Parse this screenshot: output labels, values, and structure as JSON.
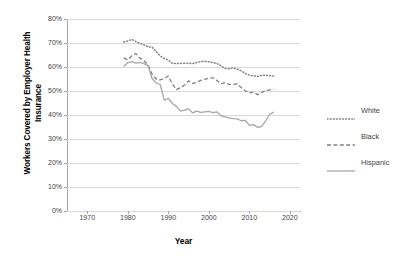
{
  "chart_data": {
    "type": "line",
    "title": "",
    "xlabel": "Year",
    "ylabel": "Workers Covered by Employer Health Insurance",
    "ylabel_line1": "Workers Covered by Employer Health",
    "ylabel_line2": "Insurance",
    "xlim": [
      1965,
      12020
    ],
    "x_axis_min": 1965,
    "x_axis_max": 2022.5,
    "ylim": [
      0,
      80
    ],
    "y_unit": "%",
    "grid": true,
    "legend_position": "right",
    "x_ticks": [
      "1970",
      "1980",
      "1990",
      "2000",
      "2010",
      "2020"
    ],
    "x_tick_values": [
      1970,
      1980,
      1990,
      2000,
      2010,
      2020
    ],
    "y_ticks": [
      "0%",
      "10%",
      "20%",
      "30%",
      "40%",
      "50%",
      "60%",
      "70%",
      "80%"
    ],
    "y_tick_values": [
      0,
      10,
      20,
      30,
      40,
      50,
      60,
      70,
      80
    ],
    "x": [
      1979,
      1980,
      1981,
      1982,
      1983,
      1984,
      1985,
      1986,
      1987,
      1988,
      1989,
      1990,
      1991,
      1992,
      1993,
      1994,
      1995,
      1996,
      1997,
      1998,
      1999,
      2000,
      2001,
      2002,
      2003,
      2004,
      2005,
      2006,
      2007,
      2008,
      2009,
      2010,
      2011,
      2012,
      2013,
      2014,
      2015,
      2016
    ],
    "series": [
      {
        "name": "White",
        "style": "dotted",
        "color": "#808080",
        "values": [
          70.4,
          70.8,
          71.5,
          70.6,
          69.8,
          69.2,
          68.4,
          68.3,
          66.4,
          64.6,
          63.6,
          62.9,
          61.5,
          61.4,
          61.5,
          61.6,
          61.6,
          61.4,
          61.9,
          62.2,
          62.4,
          62.2,
          61.8,
          61.5,
          60.5,
          59.4,
          59.3,
          59.6,
          59.1,
          58.4,
          57.3,
          56.6,
          56.3,
          56.1,
          56.5,
          56.6,
          56.4,
          56.2
        ]
      },
      {
        "name": "Black",
        "style": "dashed",
        "color": "#808080",
        "values": [
          63.8,
          63.0,
          64.7,
          65.6,
          63.7,
          62.6,
          60.8,
          57.0,
          55.0,
          54.6,
          55.3,
          56.2,
          53.0,
          50.6,
          51.4,
          52.5,
          54.2,
          53.2,
          53.6,
          54.4,
          54.8,
          55.4,
          55.5,
          54.4,
          53.0,
          53.5,
          52.8,
          52.7,
          53.0,
          51.4,
          50.1,
          49.2,
          49.5,
          48.5,
          49.3,
          50.2,
          50.5,
          50.7
        ]
      },
      {
        "name": "Hispanic",
        "style": "solid",
        "color": "#a6a6a6",
        "values": [
          60.2,
          61.8,
          62.2,
          61.6,
          61.9,
          61.4,
          60.6,
          55.2,
          53.4,
          52.7,
          46.2,
          46.9,
          44.8,
          43.6,
          41.6,
          42.0,
          42.6,
          40.9,
          41.6,
          41.1,
          41.3,
          41.5,
          41.0,
          41.3,
          39.7,
          39.2,
          38.8,
          38.5,
          38.4,
          37.6,
          37.8,
          35.7,
          36.0,
          34.9,
          35.2,
          37.6,
          40.2,
          41.2
        ]
      }
    ]
  },
  "legend": {
    "items": [
      {
        "label": "White"
      },
      {
        "label": "Black"
      },
      {
        "label": "Hispanic"
      }
    ]
  }
}
